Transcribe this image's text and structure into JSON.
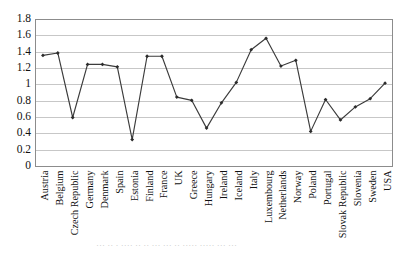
{
  "chart_data": {
    "type": "line",
    "title": "",
    "xlabel": "",
    "ylabel": "",
    "ylim": [
      0,
      1.8
    ],
    "ytick_step": 0.2,
    "grid": true,
    "legend": false,
    "marker": "diamond",
    "line_color": "#3b3b3b",
    "marker_color": "#2b2b2b",
    "grid_color": "#b9b9b9",
    "yticks": [
      "0",
      "0.2",
      "0.4",
      "0.6",
      "0.8",
      "1",
      "1.2",
      "1.4",
      "1.6",
      "1.8"
    ],
    "categories": [
      "Austria",
      "Belgium",
      "Czech Republic",
      "Germany",
      "Denmark",
      "Spain",
      "Estonia",
      "Finland",
      "France",
      "UK",
      "Greece",
      "Hungary",
      "Ireland",
      "Iceland",
      "Italy",
      "Luxembourg",
      "Netherlands",
      "Norway",
      "Poland",
      "Portugal",
      "Slovak Republic",
      "Slovenia",
      "Sweden",
      "USA"
    ],
    "values": [
      1.36,
      1.39,
      0.6,
      1.25,
      1.25,
      1.22,
      0.33,
      1.35,
      1.35,
      0.85,
      0.81,
      0.47,
      0.78,
      1.03,
      1.43,
      1.57,
      1.23,
      1.3,
      0.43,
      0.82,
      0.57,
      0.73,
      0.83,
      1.02
    ]
  },
  "caption": {
    "partial_text": "··· ·· · ···· ·· ·· ··· ··· ·· ····· ····· ··· ···"
  }
}
